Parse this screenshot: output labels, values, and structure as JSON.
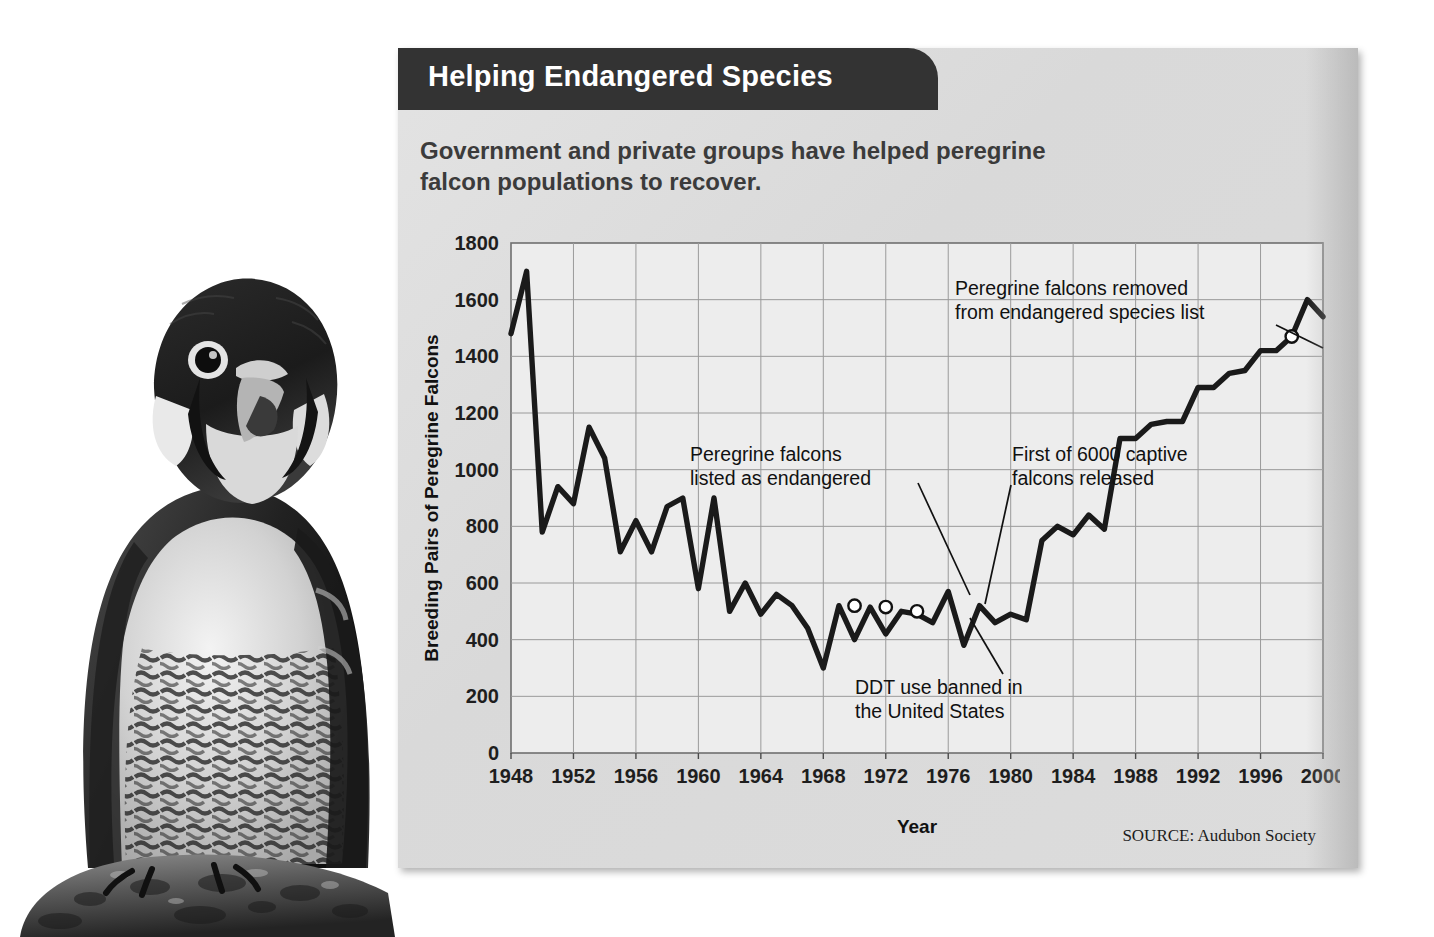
{
  "panel": {
    "title": "Helping Endangered Species",
    "subtitle": "Government and private groups have helped peregrine falcon populations to recover.",
    "source": "SOURCE: Audubon Society",
    "colors": {
      "title_bar": "#333333",
      "panel_bg": "#dcdcdc",
      "plot_bg": "#ededed",
      "line": "#1a1a1a",
      "grid": "#9a9a9a"
    }
  },
  "photo": {
    "subject": "peregrine-falcon",
    "style": "black-and-white photograph",
    "perch": "rock"
  },
  "chart_data": {
    "type": "line",
    "title": "Government and private groups have helped peregrine falcon populations to recover.",
    "xlabel": "Year",
    "ylabel": "Breeding Pairs of Peregrine Falcons",
    "xlim": [
      1948,
      2000
    ],
    "ylim": [
      0,
      1800
    ],
    "yticks": [
      0,
      200,
      400,
      600,
      800,
      1000,
      1200,
      1400,
      1600,
      1800
    ],
    "xticks": [
      1948,
      1952,
      1956,
      1960,
      1964,
      1968,
      1972,
      1976,
      1980,
      1984,
      1988,
      1992,
      1996,
      2000
    ],
    "grid": true,
    "legend": "none",
    "series": [
      {
        "name": "Breeding pairs of peregrine falcons",
        "x": [
          1948,
          1949,
          1950,
          1951,
          1952,
          1953,
          1954,
          1955,
          1956,
          1957,
          1958,
          1959,
          1960,
          1961,
          1962,
          1963,
          1964,
          1965,
          1966,
          1967,
          1968,
          1969,
          1970,
          1971,
          1972,
          1973,
          1974,
          1975,
          1976,
          1977,
          1978,
          1979,
          1980,
          1981,
          1982,
          1983,
          1984,
          1985,
          1986,
          1987,
          1988,
          1989,
          1990,
          1991,
          1992,
          1993,
          1994,
          1995,
          1996,
          1997,
          1998,
          1999,
          2000
        ],
        "values": [
          1480,
          1700,
          780,
          940,
          880,
          1150,
          1040,
          710,
          820,
          710,
          870,
          900,
          580,
          900,
          500,
          600,
          490,
          560,
          520,
          440,
          300,
          520,
          400,
          515,
          420,
          500,
          490,
          460,
          570,
          380,
          520,
          460,
          490,
          470,
          750,
          800,
          770,
          840,
          790,
          1110,
          1110,
          1160,
          1170,
          1170,
          1290,
          1290,
          1340,
          1350,
          1420,
          1420,
          1470,
          1600,
          1540
        ]
      }
    ],
    "markers": [
      {
        "x": 1970,
        "y": 520,
        "label": "peregrine-falcons-listed-as-endangered"
      },
      {
        "x": 1972,
        "y": 515,
        "label": "ddt-use-banned"
      },
      {
        "x": 1974,
        "y": 500,
        "label": "first-captive-falcons-released"
      },
      {
        "x": 1998,
        "y": 1470,
        "label": "peregrine-falcons-removed-from-list"
      }
    ],
    "annotations": [
      {
        "id": "listed",
        "lines": [
          "Peregrine falcons",
          "listed as endangered"
        ]
      },
      {
        "id": "ddt",
        "lines": [
          "DDT use banned in",
          "the United States"
        ]
      },
      {
        "id": "captive",
        "lines": [
          "First of 6000 captive",
          "falcons released"
        ]
      },
      {
        "id": "delisted",
        "lines": [
          "Peregrine falcons removed",
          "from endangered species list"
        ]
      }
    ]
  }
}
